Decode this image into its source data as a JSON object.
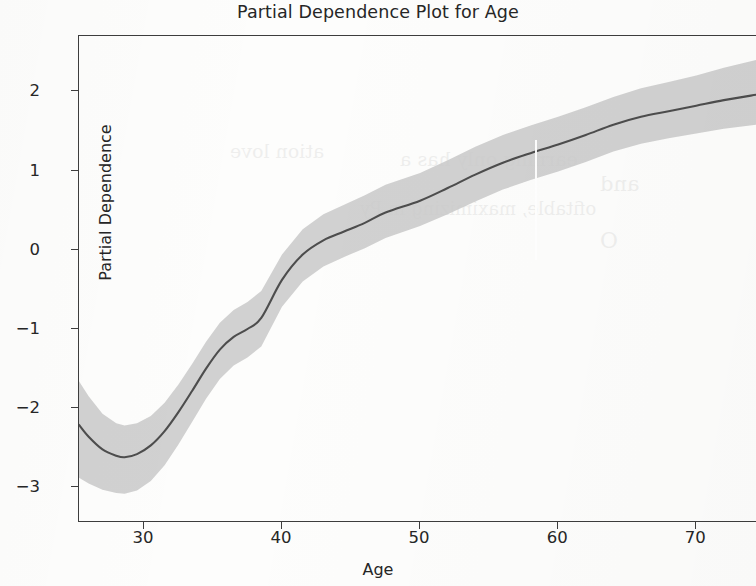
{
  "chart_data": {
    "type": "line",
    "title": "Partial Dependence Plot for Age",
    "xlabel": "Age",
    "ylabel": "Partial Dependence",
    "grid": false,
    "legend": null,
    "xlim": [
      25.3,
      74.4
    ],
    "ylim": [
      -3.45,
      2.7
    ],
    "xticks": [
      30,
      40,
      50,
      60,
      70
    ],
    "xtick_labels": [
      "30",
      "40",
      "50",
      "60",
      "70"
    ],
    "yticks": [
      2,
      1,
      0,
      -1,
      -2,
      -3
    ],
    "ytick_labels": [
      "2",
      "1",
      "0",
      "−1",
      "−2",
      "−3"
    ],
    "series": [
      {
        "name": "Partial dependence",
        "color": "#4d4d4d",
        "x": [
          25.3,
          26.0,
          27.0,
          28.0,
          28.6,
          29.5,
          30.5,
          31.5,
          32.5,
          33.5,
          34.5,
          35.5,
          36.5,
          37.5,
          38.5,
          40.0,
          41.5,
          43.0,
          44.5,
          46.0,
          47.5,
          50.0,
          52.0,
          54.0,
          56.0,
          58.0,
          60.0,
          62.0,
          64.0,
          66.0,
          68.0,
          70.0,
          72.0,
          74.4
        ],
        "y": [
          -2.21,
          -2.36,
          -2.52,
          -2.6,
          -2.62,
          -2.58,
          -2.47,
          -2.29,
          -2.05,
          -1.78,
          -1.5,
          -1.26,
          -1.1,
          -1.0,
          -0.86,
          -0.38,
          -0.06,
          0.12,
          0.23,
          0.34,
          0.47,
          0.62,
          0.78,
          0.95,
          1.1,
          1.22,
          1.33,
          1.45,
          1.58,
          1.68,
          1.75,
          1.82,
          1.89,
          1.96
        ]
      }
    ],
    "confidence_band": {
      "name": "Confidence interval",
      "color": "#c9c9c9",
      "opacity": 0.85,
      "x": [
        25.3,
        26.0,
        27.0,
        28.0,
        28.6,
        29.5,
        30.5,
        31.5,
        32.5,
        33.5,
        34.5,
        35.5,
        36.5,
        37.5,
        38.5,
        40.0,
        41.5,
        43.0,
        44.5,
        46.0,
        47.5,
        50.0,
        52.0,
        54.0,
        56.0,
        58.0,
        60.0,
        62.0,
        64.0,
        66.0,
        68.0,
        70.0,
        72.0,
        74.4
      ],
      "upper": [
        -1.66,
        -1.85,
        -2.07,
        -2.19,
        -2.22,
        -2.19,
        -2.1,
        -1.93,
        -1.7,
        -1.44,
        -1.16,
        -0.92,
        -0.76,
        -0.66,
        -0.52,
        -0.06,
        0.26,
        0.45,
        0.57,
        0.69,
        0.82,
        0.97,
        1.13,
        1.3,
        1.45,
        1.57,
        1.68,
        1.8,
        1.93,
        2.04,
        2.12,
        2.2,
        2.3,
        2.4
      ],
      "lower": [
        -2.88,
        -2.95,
        -3.03,
        -3.07,
        -3.08,
        -3.04,
        -2.92,
        -2.72,
        -2.46,
        -2.17,
        -1.88,
        -1.63,
        -1.46,
        -1.36,
        -1.22,
        -0.72,
        -0.4,
        -0.21,
        -0.09,
        0.02,
        0.15,
        0.3,
        0.45,
        0.61,
        0.76,
        0.88,
        0.99,
        1.11,
        1.24,
        1.34,
        1.41,
        1.47,
        1.53,
        1.58
      ]
    }
  },
  "axes": {
    "title": "Partial Dependence Plot for Age",
    "x_axis_label": "Age",
    "y_axis_label": "Partial Dependence"
  },
  "artifacts": {
    "bleed_text": [
      "ation love",
      "earning only has a",
      "and",
      "ofitable, maximizing in Py",
      "O"
    ]
  }
}
